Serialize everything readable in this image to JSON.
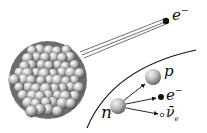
{
  "diagram": {
    "labels": {
      "emitted_electron": "e",
      "emitted_electron_charge": "−",
      "proton": "p",
      "electron": "e",
      "electron_charge": "−",
      "antineutrino": "ν̄",
      "antineutrino_sub": "e",
      "neutron": "n"
    },
    "nodes": [
      {
        "id": "nucleus",
        "kind": "nucleus"
      },
      {
        "id": "emitted-electron",
        "kind": "particle",
        "label": "e−"
      },
      {
        "id": "neutron",
        "kind": "particle",
        "label": "n"
      },
      {
        "id": "proton",
        "kind": "particle",
        "label": "p"
      },
      {
        "id": "electron",
        "kind": "particle",
        "label": "e−"
      },
      {
        "id": "antineutrino",
        "kind": "particle",
        "label": "ν̄e"
      }
    ],
    "edges": [
      {
        "from": "nucleus",
        "to": "emitted-electron",
        "style": "motion-trail"
      },
      {
        "from": "neutron",
        "to": "proton",
        "style": "arrow"
      },
      {
        "from": "neutron",
        "to": "electron",
        "style": "arrow"
      },
      {
        "from": "neutron",
        "to": "antineutrino",
        "style": "arrow"
      }
    ],
    "colors": {
      "nucleon_light": "#f2f2f2",
      "nucleon_dark": "#6a6a6a",
      "ink": "#111111"
    }
  }
}
